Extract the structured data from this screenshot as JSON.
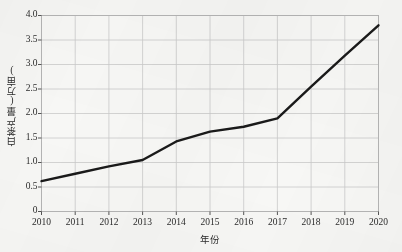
{
  "chart_data": {
    "type": "line",
    "title": "",
    "xlabel": "年份",
    "ylabel": "白茶产量(万亩)",
    "categories": [
      "2010",
      "2011",
      "2012",
      "2013",
      "2014",
      "2015",
      "2016",
      "2017",
      "2018",
      "2019",
      "2020"
    ],
    "values": [
      0.62,
      0.77,
      0.92,
      1.05,
      1.43,
      1.63,
      1.73,
      1.9,
      2.55,
      3.18,
      3.8
    ],
    "series": [
      {
        "name": "白茶产量(万亩)",
        "values": [
          0.62,
          0.77,
          0.92,
          1.05,
          1.43,
          1.63,
          1.73,
          1.9,
          2.55,
          3.18,
          3.8
        ]
      }
    ],
    "ylim": [
      0,
      4.0
    ],
    "ytick_labels": [
      "0",
      "0.5",
      "1.0",
      "1.5",
      "2.0",
      "2.5",
      "3.0",
      "3.5",
      "4.0"
    ],
    "ytick_values": [
      0,
      0.5,
      1.0,
      1.5,
      2.0,
      2.5,
      3.0,
      3.5,
      4.0
    ],
    "xtick_labels": [
      "2010",
      "2011",
      "2012",
      "2013",
      "2014",
      "2015",
      "2016",
      "2017",
      "2018",
      "2019",
      "2020"
    ],
    "grid": true,
    "grid_color": "#c9c9c9",
    "legend": false,
    "legend_position": "none",
    "line_color": "#1a1a1a",
    "line_width": 2.4,
    "plot_background": "#f7f7f5",
    "border_color": "#b4b4b4",
    "annotations": []
  }
}
